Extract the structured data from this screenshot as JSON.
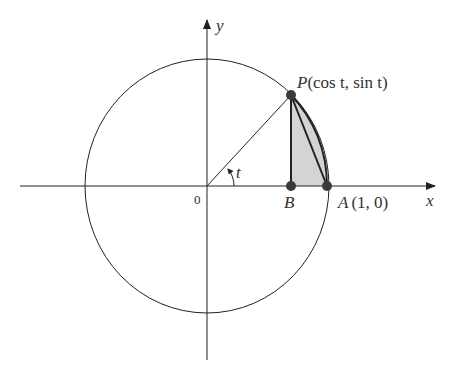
{
  "figure": {
    "type": "unit-circle-diagram",
    "labels": {
      "x_axis": "x",
      "y_axis": "y",
      "origin": "0",
      "angle": "t",
      "point_P": "P(cos t, sin t)",
      "point_P_name": "P",
      "point_P_coords": "(cos t, sin t)",
      "point_A": "A (1, 0)",
      "point_A_name": "A",
      "point_A_coords": "(1, 0)",
      "point_B": "B"
    },
    "colors": {
      "line": "#2a2a2a",
      "point": "#3a3a3a",
      "shaded_region": "#d4d4d4",
      "text": "#333333"
    },
    "geometry": {
      "origin_px": [
        207,
        186
      ],
      "radius_x_px": 122,
      "radius_y_px": 127,
      "P_px": [
        291,
        95
      ],
      "B_px": [
        291,
        186
      ],
      "A_px": [
        327,
        186
      ]
    }
  }
}
